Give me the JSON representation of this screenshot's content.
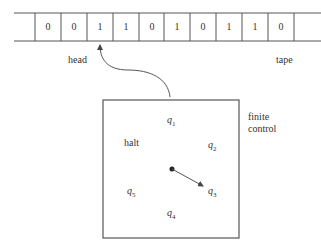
{
  "tape": {
    "label": "tape",
    "cells": [
      "0",
      "0",
      "1",
      "1",
      "0",
      "1",
      "0",
      "1",
      "1",
      "0"
    ],
    "head_position": 2
  },
  "head": {
    "label": "head"
  },
  "finite_control": {
    "label_line1": "finite",
    "label_line2": "control",
    "halt_label": "halt",
    "states": [
      {
        "base": "q",
        "sub": "1"
      },
      {
        "base": "q",
        "sub": "2"
      },
      {
        "base": "q",
        "sub": "3"
      },
      {
        "base": "q",
        "sub": "4"
      },
      {
        "base": "q",
        "sub": "5"
      }
    ],
    "pointer_target": "q3"
  },
  "colors": {
    "line": "#555555",
    "text": "#333333"
  }
}
